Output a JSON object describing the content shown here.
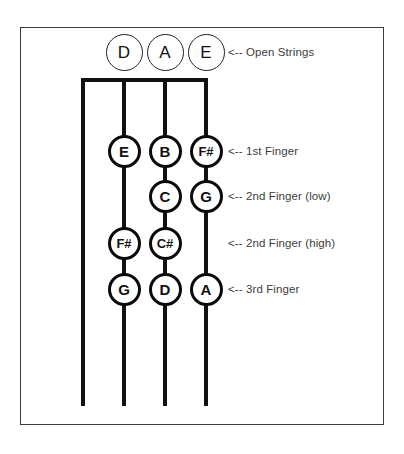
{
  "diagram": {
    "frame_color": "#3b3b3b",
    "string_color": "#111111",
    "label_color": "#3c3c3c",
    "strings": [
      {
        "name": "G",
        "x": 83
      },
      {
        "name": "D",
        "x": 124
      },
      {
        "name": "A",
        "x": 165
      },
      {
        "name": "E",
        "x": 206
      }
    ],
    "rows": [
      {
        "id": "open-strings",
        "label": "<-- Open Strings",
        "y": 52,
        "kind": "open",
        "notes": [
          {
            "string": "G",
            "x": 83,
            "text": "",
            "shown": false
          },
          {
            "string": "D",
            "x": 124,
            "text": "D",
            "shown": true
          },
          {
            "string": "A",
            "x": 165,
            "text": "A",
            "shown": true
          },
          {
            "string": "E",
            "x": 206,
            "text": "E",
            "shown": true
          }
        ]
      },
      {
        "id": "first-finger",
        "label": "<-- 1st Finger",
        "y": 151,
        "kind": "fretted",
        "notes": [
          {
            "string": "G",
            "x": 83,
            "text": "",
            "shown": false
          },
          {
            "string": "D",
            "x": 124,
            "text": "E",
            "shown": true
          },
          {
            "string": "A",
            "x": 165,
            "text": "B",
            "shown": true
          },
          {
            "string": "E",
            "x": 206,
            "text": "F#",
            "shown": true
          }
        ]
      },
      {
        "id": "second-finger-low",
        "label": "<-- 2nd Finger (low)",
        "y": 196,
        "kind": "fretted",
        "notes": [
          {
            "string": "G",
            "x": 83,
            "text": "",
            "shown": false
          },
          {
            "string": "D",
            "x": 124,
            "text": "",
            "shown": false
          },
          {
            "string": "A",
            "x": 165,
            "text": "C",
            "shown": true
          },
          {
            "string": "E",
            "x": 206,
            "text": "G",
            "shown": true
          }
        ]
      },
      {
        "id": "second-finger-high",
        "label": "<-- 2nd Finger (high)",
        "y": 243,
        "kind": "fretted",
        "notes": [
          {
            "string": "G",
            "x": 83,
            "text": "",
            "shown": false
          },
          {
            "string": "D",
            "x": 124,
            "text": "F#",
            "shown": true
          },
          {
            "string": "A",
            "x": 165,
            "text": "C#",
            "shown": true
          },
          {
            "string": "E",
            "x": 206,
            "text": "",
            "shown": false
          }
        ]
      },
      {
        "id": "third-finger",
        "label": "<-- 3rd Finger",
        "y": 289,
        "kind": "fretted",
        "notes": [
          {
            "string": "G",
            "x": 83,
            "text": "",
            "shown": false
          },
          {
            "string": "D",
            "x": 124,
            "text": "G",
            "shown": true
          },
          {
            "string": "A",
            "x": 165,
            "text": "D",
            "shown": true
          },
          {
            "string": "E",
            "x": 206,
            "text": "A",
            "shown": true
          }
        ]
      }
    ],
    "nut": {
      "y": 78,
      "x_start": 83,
      "x_end": 206
    },
    "string_span": {
      "y_top": 78,
      "y_bottom": 406
    }
  }
}
